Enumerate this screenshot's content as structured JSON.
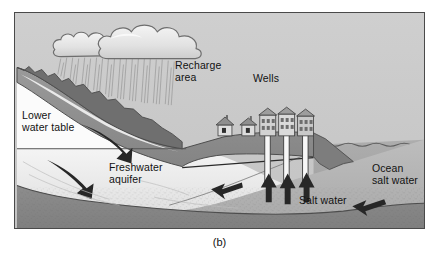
{
  "figure": {
    "caption": "(b)",
    "kind": "hydrogeology-cross-section"
  },
  "labels": {
    "recharge_area": "Recharge\narea",
    "wells": "Wells",
    "lower_water_table": "Lower\nwater table",
    "freshwater_aquifer": "Freshwater\naquifer",
    "salt_water": "Salt water",
    "ocean_salt_water": "Ocean\nsalt water"
  },
  "features": {
    "cloud": "rain-cloud",
    "rain": "rain-streaks",
    "mountain": "mountain-slope",
    "houses": 2,
    "buildings": 3,
    "well_shafts": 3,
    "water_table_line": "horizontal-water-table",
    "ocean_surface": "wavy-ocean-surface",
    "bedrock": "stippled-bedrock"
  },
  "arrows": {
    "groundwater_flow": [
      "down-right-upper",
      "down-right-lower"
    ],
    "saltwater_upconing": [
      "up-well-1",
      "up-well-2",
      "up-well-3"
    ],
    "intrusion_inland": "left-arrow-inland",
    "intrusion_from_ocean": "left-arrow-from-ocean"
  },
  "colors": {
    "sky": "#c9c9c9",
    "ocean": "#a3a3a3",
    "freshwater": "#ececec",
    "saltwater_wedge": "#b5b5b5",
    "land_surface": "#8f8f8f",
    "bedrock": "#9a9a9a",
    "cloud": "#e8e8e8",
    "outline": "#3a3a3a",
    "text": "#121212",
    "frame": "#4a4a4a"
  }
}
